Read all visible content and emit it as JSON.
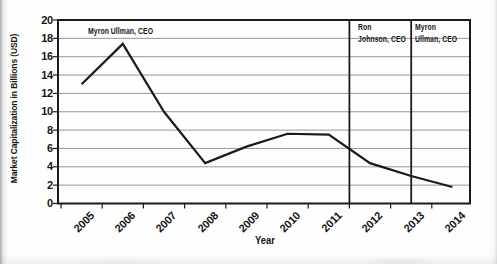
{
  "figure": {
    "background": "#fefefe",
    "line_color": "#1b1b1b",
    "grid_color": "#8c8c8c",
    "border_color": "#1b1b1b",
    "divider_color": "#1b1b1b",
    "text_color": "#161616"
  },
  "chart_data": {
    "type": "line",
    "title": "",
    "xlabel": "Year",
    "ylabel": "Market Capitalization in Billions (USD)",
    "categories": [
      "2005",
      "2006",
      "2007",
      "2008",
      "2009",
      "2010",
      "2011",
      "2012",
      "2013",
      "2014"
    ],
    "values": [
      13,
      17.4,
      10,
      4.4,
      6.2,
      7.6,
      7.5,
      4.4,
      3,
      1.8
    ],
    "ylim": [
      0,
      20
    ],
    "ytick_step": 2,
    "grid": true,
    "legend": "none",
    "divider_years": [
      2012,
      2013.5
    ],
    "ceo_periods": [
      {
        "name": "Myron Ullman, CEO",
        "label_lines": [
          "Myron Ullman, CEO"
        ]
      },
      {
        "name": "Ron Johnson, CEO",
        "label_lines": [
          "Ron",
          "Johnson, CEO"
        ]
      },
      {
        "name": "Myron Ullman, CEO",
        "label_lines": [
          "Myron",
          "Ullman, CEO"
        ]
      }
    ]
  }
}
